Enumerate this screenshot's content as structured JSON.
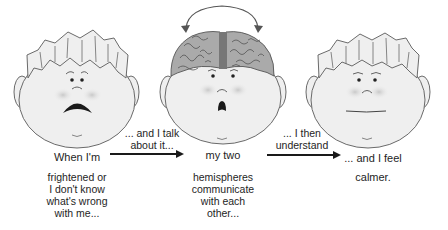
{
  "diagram": {
    "panels": [
      {
        "id": "frightened",
        "expression": "sad-frown",
        "caption_top": "When I'm",
        "caption_lines": [
          "frightened or",
          "I don't know",
          "what's wrong",
          "with  me..."
        ]
      },
      {
        "id": "hemispheres",
        "expression": "surprised-o",
        "shows_brain": true,
        "caption_top": "my two",
        "caption_lines": [
          "hemispheres",
          "communicate",
          "with  each",
          "other..."
        ]
      },
      {
        "id": "calm",
        "expression": "neutral-flat",
        "caption_top": "... and I feel",
        "caption_lines": [
          "calmer."
        ]
      }
    ],
    "arrows": [
      {
        "from": "frightened",
        "to": "hemispheres",
        "label_lines": [
          "... and I talk",
          "about it..."
        ]
      },
      {
        "from": "hemispheres",
        "to": "calm",
        "label_lines": [
          "... I then",
          "understand"
        ]
      }
    ],
    "brain_arrow": {
      "icon": "curved-double-arrow-icon",
      "meaning": "communication between hemispheres"
    },
    "colors": {
      "outline": "#6a6a6a",
      "face_fill": "#efefef",
      "cheek": "#c9c9c9",
      "brain_fill": "#a9a9a9",
      "brain_line": "#555555",
      "arrow": "#1a1a1a",
      "text": "#1e1e1e"
    }
  }
}
